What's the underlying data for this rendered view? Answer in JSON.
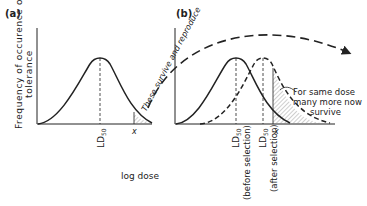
{
  "panels": {
    "a": {
      "label": "(a)",
      "ld50": "LD",
      "ld50_sub": "50",
      "x_marker": "x"
    },
    "b": {
      "label": "(b)",
      "ld50_before": "LD",
      "ld50_before_sub": "50",
      "ld50_before_note": "(before selection)",
      "ld50_after": "LD",
      "ld50_after_sub": "50",
      "ld50_after_note": "(after selection)",
      "x_marker": "x"
    }
  },
  "axes": {
    "ylabel_line1": "Frequency of occurence of",
    "ylabel_line2": "tolerance",
    "xlabel": "log dose"
  },
  "annotations": {
    "arrow_text": "These survive and reproduce",
    "note_line1": "For same dose",
    "note_line2": "many more now",
    "note_line3": "survive"
  },
  "colors": {
    "ink": "#222222",
    "hatch": "#888888"
  }
}
